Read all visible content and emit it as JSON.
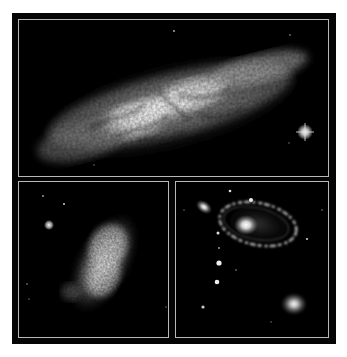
{
  "figure": {
    "frame_color": "#b8b8b8",
    "background_color": "#050505",
    "panels": [
      {
        "id": "top",
        "subject": "edge-on starburst galaxy with dust lanes",
        "features": [
          "bright elongated disk",
          "dark dust filaments",
          "foreground star with diffraction spikes"
        ]
      },
      {
        "id": "bottom-left",
        "subject": "irregular galaxy",
        "features": [
          "clumpy elongated body",
          "nearby point star"
        ]
      },
      {
        "id": "bottom-right",
        "subject": "ring galaxy with companions",
        "features": [
          "elliptical ring with bright core",
          "small elliptical galaxy upper-left",
          "elliptical galaxy lower-right",
          "chain of faint stars"
        ]
      }
    ]
  }
}
